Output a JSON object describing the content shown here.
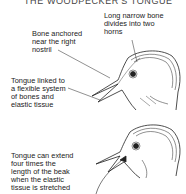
{
  "title": "THE WOODPECKER'S TONGUE",
  "labels": {
    "bone_horns": "Long narrow bone\ndivides into two\nhorns",
    "bone_nostril": "Bone anchored\nnear the right\nnostril",
    "tongue_linked": "Tongue linked to\na flexible system\nof bones and\nelastic tissue",
    "tongue_extend": "Tongue can extend\nfour times the\nlength of the beak\nwhen the elastic\ntissue is stretched"
  }
}
